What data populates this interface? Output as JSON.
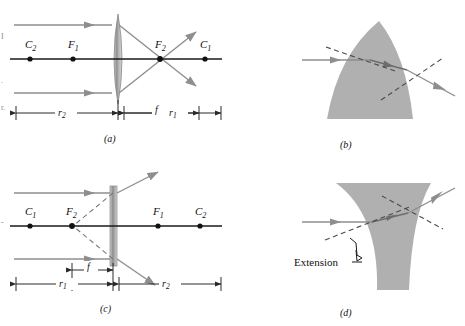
{
  "figure": {
    "colors": {
      "axis": "#1a1a1a",
      "ray": "#8e8e8e",
      "ray_dark": "#6d6d6d",
      "dashed": "#4a4a4a",
      "glass_fill": "#b0b0b0",
      "lens_fill": "#9a9a9a",
      "dimension": "#2a2a2a",
      "label": "#111111",
      "background": "#ffffff"
    },
    "panels": [
      {
        "id": "a",
        "label": "(a)",
        "type": "converging-lens-ray-diagram",
        "lens_kind": "biconvex",
        "axis_points": [
          {
            "name": "C2",
            "label": "C",
            "sub": "2",
            "x": 30
          },
          {
            "name": "F1",
            "label": "F",
            "sub": "1",
            "x": 73
          },
          {
            "name": "F2",
            "label": "F",
            "sub": "2",
            "x": 160
          },
          {
            "name": "C1",
            "label": "C",
            "sub": "1",
            "x": 205
          }
        ],
        "dimensions": [
          {
            "name": "r2",
            "label": "r",
            "sub": "2"
          },
          {
            "name": "f",
            "label": "f",
            "sub": ""
          },
          {
            "name": "r1",
            "label": "r",
            "sub": "1"
          }
        ]
      },
      {
        "id": "b",
        "label": "(b)",
        "type": "prism-refraction-converging",
        "shape": "pointed-lens-element"
      },
      {
        "id": "c",
        "label": "(c)",
        "type": "diverging-lens-ray-diagram",
        "lens_kind": "thin-diverging",
        "axis_points": [
          {
            "name": "C1",
            "label": "C",
            "sub": "1",
            "x": 30
          },
          {
            "name": "F2",
            "label": "F",
            "sub": "2",
            "x": 72
          },
          {
            "name": "F1",
            "label": "F",
            "sub": "1",
            "x": 158
          },
          {
            "name": "C2",
            "label": "C",
            "sub": "2",
            "x": 200
          }
        ],
        "dimensions": [
          {
            "name": "r1",
            "label": "r",
            "sub": "1"
          },
          {
            "name": "f",
            "label": "f",
            "sub": ""
          },
          {
            "name": "r2",
            "label": "r",
            "sub": "2"
          }
        ]
      },
      {
        "id": "d",
        "label": "(d)",
        "type": "prism-refraction-diverging",
        "shape": "flared-lens-element",
        "annotation": "Extension"
      }
    ],
    "labels": {
      "panel_a": "(a)",
      "panel_b": "(b)",
      "panel_c": "(c)",
      "panel_d": "(d)",
      "extension": "Extension",
      "C": "C",
      "F": "F",
      "r": "r",
      "f": "f",
      "sub1": "1",
      "sub2": "2"
    },
    "margin_text": {
      "line1": "I",
      "line2": ".",
      "line3": "r.",
      "line4": "-"
    }
  }
}
